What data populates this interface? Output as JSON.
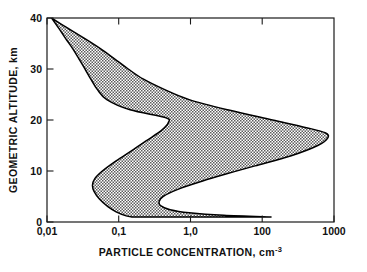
{
  "chart_data": {
    "type": "area",
    "title": "",
    "subtitle": "",
    "xlabel": "PARTICLE CONCENTRATION, cm",
    "xlabel_exponent": "-3",
    "ylabel": "GEOMETRIC ALTITUDE, km",
    "xscale": "log",
    "yscale": "linear",
    "xlim": [
      0.01,
      1000
    ],
    "ylim": [
      0,
      40
    ],
    "grid": false,
    "legend": false,
    "legend_position": "none",
    "xticks": [
      0.01,
      0.1,
      1.0,
      100,
      1000
    ],
    "xticklabels": [
      "0,01",
      "0,1",
      "1,0",
      "100",
      "1000"
    ],
    "yticks": [
      0,
      10,
      20,
      30,
      40
    ],
    "yticklabels": [
      "0",
      "10",
      "20",
      "30",
      "40"
    ],
    "fill_style": "hatched-gray",
    "fill_color": "#8f8f8f",
    "outline_color": "#000000",
    "band_description": "Shaded envelope of atmospheric particle concentration versus geometric altitude, bounded by a lower (minimum) and an upper (maximum) concentration profile.",
    "series": [
      {
        "name": "lower bound (minimum concentration)",
        "altitude_km": [
          40,
          38,
          36,
          34,
          32,
          30,
          28,
          26,
          24,
          22,
          20.5,
          19.5,
          18,
          16,
          14,
          12,
          10,
          8.5,
          7.2,
          6.0,
          4.5,
          3.0,
          2.0,
          1.2,
          1.0
        ],
        "concentration_cm3": [
          0.012,
          0.016,
          0.021,
          0.028,
          0.036,
          0.046,
          0.058,
          0.075,
          0.11,
          0.28,
          1.15,
          1.3,
          1.0,
          0.55,
          0.3,
          0.16,
          0.092,
          0.068,
          0.062,
          0.066,
          0.082,
          0.115,
          0.16,
          0.24,
          0.3
        ]
      },
      {
        "name": "upper bound (maximum concentration)",
        "altitude_km": [
          40,
          38,
          36,
          34,
          32,
          30,
          28,
          26,
          24,
          22,
          20,
          18.5,
          17.5,
          16.5,
          15,
          13,
          11,
          9.5,
          8,
          6.5,
          5.0,
          4.0,
          3.2,
          2.4,
          1.8,
          1.3,
          1.0
        ],
        "concentration_cm3": [
          0.012,
          0.023,
          0.045,
          0.085,
          0.15,
          0.26,
          0.48,
          1.1,
          3.0,
          14,
          85,
          330,
          700,
          780,
          520,
          180,
          42,
          14,
          5.0,
          2.0,
          1.05,
          0.9,
          0.95,
          1.4,
          3.0,
          12,
          80
        ]
      }
    ]
  },
  "figure": {
    "background_color": "#ffffff",
    "axis_color": "#1a1a1a",
    "text_color": "#111111"
  }
}
